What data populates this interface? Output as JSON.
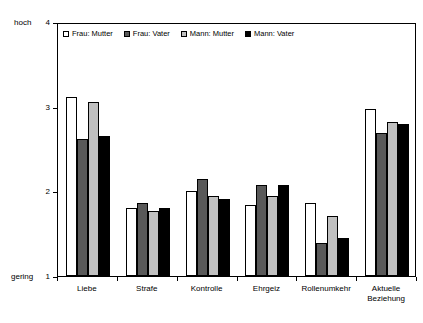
{
  "chart_data": {
    "type": "bar",
    "title": "",
    "subtitle": "",
    "xlabel": "",
    "ylabel": "",
    "ylim": [
      1,
      4
    ],
    "yticks": [
      1,
      2,
      3,
      4
    ],
    "ytick_labels": [
      "1",
      "2",
      "3",
      "4"
    ],
    "axis_low_caption": "gering",
    "axis_high_caption": "hoch",
    "grid": false,
    "legend_position": "top-left-inside",
    "categories": [
      "Liebe",
      "Strafe",
      "Kontrolle",
      "Ehrgeiz",
      "Rollenumkehr",
      "Aktuelle\nBeziehung"
    ],
    "series": [
      {
        "name": "Frau: Mutter",
        "color": "#FFFFFF",
        "values": [
          3.12,
          1.8,
          2.0,
          1.84,
          1.86,
          2.97
        ]
      },
      {
        "name": "Frau: Vater",
        "color": "#595959",
        "values": [
          2.62,
          1.86,
          2.14,
          2.08,
          1.39,
          2.69
        ]
      },
      {
        "name": "Mann: Mutter",
        "color": "#C0C0C0",
        "values": [
          3.05,
          1.77,
          1.94,
          1.95,
          1.71,
          2.82
        ]
      },
      {
        "name": "Mann: Vater",
        "color": "#000000",
        "values": [
          2.65,
          1.8,
          1.91,
          2.07,
          1.45,
          2.79
        ]
      }
    ]
  }
}
